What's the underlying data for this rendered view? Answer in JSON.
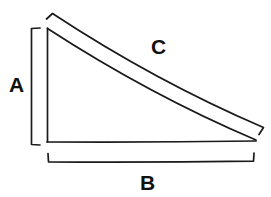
{
  "figure": {
    "kind": "right-triangle-labeled-sides-diagram",
    "background_color": "#ffffff",
    "stroke_color": "#1a1a1a",
    "stroke_width": 1.6,
    "canvas": {
      "width": 271,
      "height": 197
    },
    "labels": {
      "side_a": "A",
      "side_b": "B",
      "side_c": "C"
    },
    "label_meanings": {
      "side_a": "vertical leg (height)",
      "side_b": "horizontal leg (base)",
      "side_c": "hypotenuse"
    },
    "geometry": {
      "triangle": {
        "apex": [
          47,
          28
        ],
        "bottom_left": [
          47,
          142
        ],
        "bottom_right": [
          256,
          141
        ]
      },
      "measure_bracket_a": {
        "axis": "vertical",
        "line_x": 31,
        "y_start": 28,
        "y_end": 145,
        "tick_length": 9,
        "tick_direction": "right"
      },
      "measure_bracket_b": {
        "axis": "horizontal",
        "line_y": 162,
        "x_start": 48,
        "x_end": 254,
        "tick_length": 9,
        "tick_direction": "up"
      },
      "measure_bracket_c": {
        "axis": "diagonal",
        "start": [
          52,
          14
        ],
        "end": [
          263,
          128
        ],
        "tick_length": 9,
        "tick_direction": "perpendicular"
      }
    }
  }
}
